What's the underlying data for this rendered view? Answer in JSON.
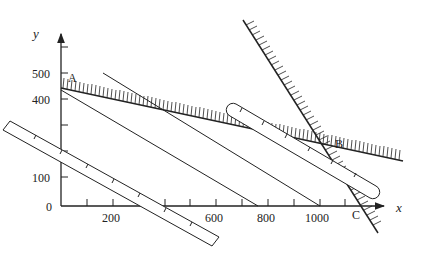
{
  "figure": {
    "type": "linear-programming-graph",
    "axes": {
      "x_label": "x",
      "y_label": "y",
      "origin_label": "0",
      "x_tick_labels": [
        "200",
        "600",
        "800",
        "1000"
      ],
      "y_tick_labels": [
        "100",
        "400",
        "500"
      ]
    },
    "points": {
      "A": "A",
      "B": "B",
      "C": "C"
    },
    "elements": [
      "constraint line through A and B (shaded above)",
      "steep constraint line through B and C (shaded right)",
      "two parallel iso-profit lines",
      "ruler positioned lower-left",
      "ruler positioned through B"
    ],
    "colors": {
      "ink": "#222222",
      "background": "#ffffff"
    }
  }
}
